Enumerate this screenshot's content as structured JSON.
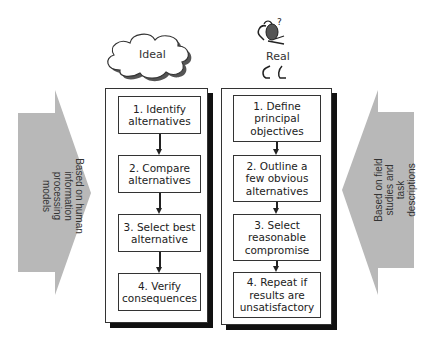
{
  "ideal": {
    "title": "Ideal",
    "steps": [
      "1. Identify\nalternatives",
      "2. Compare\nalternatives",
      "3. Select best\nalternative",
      "4. Verify\nconsequences"
    ]
  },
  "real": {
    "title": "Real",
    "steps": [
      "1. Define\nprincipal\nobjectives",
      "2. Outline a\nfew obvious\nalternatives",
      "3. Select\nreasonable\ncompromise",
      "4. Repeat if\nresults are\nunsatisfactory"
    ]
  },
  "left_arrow": {
    "label": "Based on human\ninformation\nprocessing\nmodels",
    "color": "#b8b8b8"
  },
  "right_arrow": {
    "label": "Based on field\nstudies and\ntask\ndescriptions",
    "color": "#b8b8b8"
  },
  "icons": {
    "cloud": "cloud-icon",
    "thinking_figure": "thinking-person-icon"
  },
  "colors": {
    "shadow": "#111111",
    "border": "#333333",
    "arrow_fill": "#b8b8b8"
  }
}
